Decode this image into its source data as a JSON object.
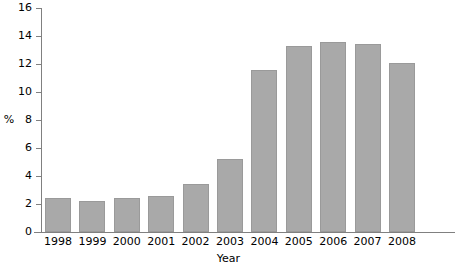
{
  "chart_data": {
    "type": "bar",
    "title": "",
    "xlabel": "Year",
    "ylabel": "%",
    "categories": [
      "1998",
      "1999",
      "2000",
      "2001",
      "2002",
      "2003",
      "2004",
      "2005",
      "2006",
      "2007",
      "2008"
    ],
    "values": [
      2.4,
      2.2,
      2.4,
      2.6,
      3.4,
      5.2,
      11.6,
      13.3,
      13.6,
      13.4,
      12.1
    ],
    "ylim": [
      0,
      16
    ],
    "yticks": [
      0,
      2,
      4,
      6,
      8,
      10,
      12,
      14,
      16
    ],
    "ytick_labels": [
      "0",
      "2",
      "4",
      "6",
      "8",
      "10",
      "12",
      "14",
      "16"
    ],
    "grid": false,
    "legend": "none",
    "bar_color": "#a9a9a9",
    "axis_color": "#808080"
  }
}
